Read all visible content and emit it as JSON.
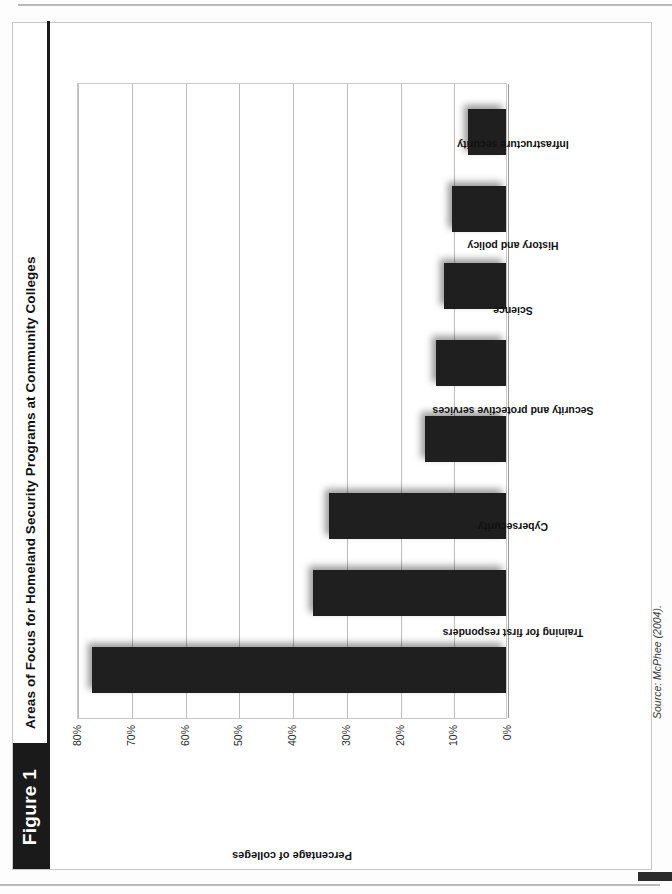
{
  "figure": {
    "badge_label": "Figure 1",
    "title": "Areas of Focus for Homeland Security Programs at Community Colleges",
    "source": "Source: McPhee (2004).",
    "accent_color": "#1a1a1a",
    "bar_color": "#1f1f1f",
    "gridline_color": "#bcbcbc"
  },
  "chart_data": {
    "type": "bar",
    "title": "Areas of Focus for Homeland Security Programs at Community Colleges",
    "xlabel": "",
    "ylabel": "Percentage of colleges",
    "ylim": [
      0,
      80
    ],
    "grid": true,
    "legend": "none",
    "orientation": "vertical",
    "categories": [
      "Training for first responders",
      "Cybersecurity",
      "Security and protective services",
      "Science",
      "History and policy",
      "Infrastructure security",
      "Counterterrorism and national security",
      "Other"
    ],
    "values": [
      77,
      36,
      33,
      15,
      13,
      11.5,
      10,
      7
    ],
    "ytick_labels": [
      "0%",
      "10%",
      "20%",
      "30%",
      "40%",
      "50%",
      "60%",
      "70%",
      "80%"
    ],
    "ytick_values": [
      0,
      10,
      20,
      30,
      40,
      50,
      60,
      70,
      80
    ]
  }
}
